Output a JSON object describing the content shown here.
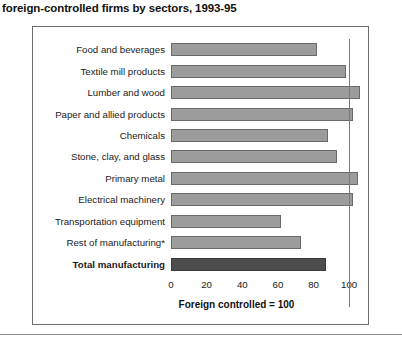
{
  "figure": {
    "title": "foreign-controlled firms by sectors, 1993-95",
    "axis_caption": "Foreign controlled = 100"
  },
  "chart_data": {
    "type": "bar",
    "orientation": "horizontal",
    "title": "foreign-controlled firms by sectors, 1993-95",
    "xlabel": "Foreign controlled = 100",
    "ylabel": "",
    "xlim": [
      0,
      110
    ],
    "grid": false,
    "reference_line": {
      "value": 100,
      "label": "Foreign controlled = 100"
    },
    "xticks": [
      0,
      20,
      40,
      60,
      80,
      100
    ],
    "xtick_labels": [
      "0",
      "20",
      "40",
      "60",
      "80",
      "100"
    ],
    "categories": [
      "Food and beverages",
      "Textile mill products",
      "Lumber and wood",
      "Paper and allied products",
      "Chemicals",
      "Stone, clay, and glass",
      "Primary metal",
      "Electrical machinery",
      "Transportation equipment",
      "Rest of manufacturing*",
      "Total manufacturing"
    ],
    "values": [
      82,
      98,
      106,
      102,
      88,
      93,
      105,
      102,
      62,
      73,
      87
    ],
    "colors": {
      "sector_bar": "#9c9c9c",
      "total_bar": "#4d4d4d",
      "bar_border": "#6a6a6a",
      "reference_line": "#7a7a7a",
      "panel_border": "#6d6d6d"
    },
    "series": [
      {
        "name": "Index relative to foreign controlled = 100",
        "values": [
          82,
          98,
          106,
          102,
          88,
          93,
          105,
          102,
          62,
          73,
          87
        ]
      }
    ]
  },
  "rows": [
    {
      "label": "Food and beverages",
      "value": 82,
      "is_total": false
    },
    {
      "label": "Textile mill products",
      "value": 98,
      "is_total": false
    },
    {
      "label": "Lumber and wood",
      "value": 106,
      "is_total": false
    },
    {
      "label": "Paper and allied products",
      "value": 102,
      "is_total": false
    },
    {
      "label": "Chemicals",
      "value": 88,
      "is_total": false
    },
    {
      "label": "Stone, clay, and glass",
      "value": 93,
      "is_total": false
    },
    {
      "label": "Primary metal",
      "value": 105,
      "is_total": false
    },
    {
      "label": "Electrical machinery",
      "value": 102,
      "is_total": false
    },
    {
      "label": "Transportation equipment",
      "value": 62,
      "is_total": false
    },
    {
      "label": "Rest of manufacturing*",
      "value": 73,
      "is_total": false
    },
    {
      "label": "Total manufacturing",
      "value": 87,
      "is_total": true
    }
  ]
}
